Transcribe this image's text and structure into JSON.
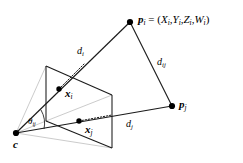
{
  "figure": {
    "type": "geometry-diagram",
    "background_color": "#ffffff",
    "stroke_color": "#000000",
    "faint_stroke_color": "#b0b0b0",
    "labels": {
      "point_pi": {
        "name": "p",
        "subscript": "i",
        "equals": " = (",
        "coords": [
          {
            "sym": "X",
            "sub": "i",
            "sep": ","
          },
          {
            "sym": "Y",
            "sub": "i",
            "sep": ","
          },
          {
            "sym": "Z",
            "sub": "i",
            "sep": ","
          },
          {
            "sym": "W",
            "sub": "i",
            "sep": ""
          }
        ],
        "close": ")",
        "full_text": "p_i = (X_i, Y_i, Z_i, W_i)"
      },
      "point_pj": {
        "name": "p",
        "subscript": "j",
        "full_text": "p_j"
      },
      "point_xi": {
        "name": "x",
        "subscript": "i",
        "full_text": "x_i"
      },
      "point_xj": {
        "name": "x",
        "subscript": "j",
        "full_text": "x_j"
      },
      "camera_centre": {
        "name": "c",
        "subscript": "",
        "full_text": "c"
      },
      "dist_di": {
        "name": "d",
        "subscript": "i",
        "full_text": "d_i"
      },
      "dist_dj": {
        "name": "d",
        "subscript": "j",
        "full_text": "d_j"
      },
      "dist_dij": {
        "name": "d",
        "subscript": "ij",
        "full_text": "d_ij"
      },
      "angle_theta": {
        "name": "θ",
        "subscript": "ij",
        "full_text": "θ_ij"
      }
    },
    "geometry": {
      "camera_centre_px": [
        16,
        133
      ],
      "point_pi_px": [
        130,
        22
      ],
      "point_pj_px": [
        172,
        106
      ],
      "point_xi_px": [
        59,
        89
      ],
      "point_xj_px": [
        79,
        121
      ],
      "image_plane_quad_px": [
        [
          46,
          66
        ],
        [
          112,
          95
        ],
        [
          112,
          148
        ],
        [
          46,
          121
        ]
      ]
    }
  }
}
